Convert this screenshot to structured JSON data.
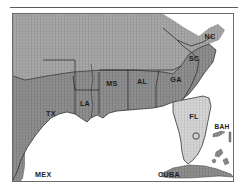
{
  "figure": {
    "type": "map",
    "frame_border_color": "#6b6b6b",
    "top_rule_color": "#5a5a5a"
  },
  "map": {
    "ocean_color": "#ffffff",
    "land_default_color": "#9a9a9a",
    "study_region_color": "#848484",
    "highlight_color": "#cfcfcf",
    "border_line_color": "#2b2b2b",
    "labels": [
      {
        "id": "tx",
        "text": "TX",
        "x": 38,
        "y": 102,
        "size": "normal"
      },
      {
        "id": "la",
        "text": "LA",
        "x": 72,
        "y": 92,
        "size": "normal"
      },
      {
        "id": "ms",
        "text": "MS",
        "x": 99,
        "y": 72,
        "size": "normal"
      },
      {
        "id": "al",
        "text": "AL",
        "x": 129,
        "y": 70,
        "size": "normal"
      },
      {
        "id": "ga",
        "text": "GA",
        "x": 163,
        "y": 68,
        "size": "normal"
      },
      {
        "id": "sc",
        "text": "SC",
        "x": 181,
        "y": 47,
        "size": "normal"
      },
      {
        "id": "nc",
        "text": "NC",
        "x": 197,
        "y": 25,
        "size": "normal"
      },
      {
        "id": "fl",
        "text": "FL",
        "x": 181,
        "y": 105,
        "size": "normal"
      },
      {
        "id": "bah",
        "text": "BAH",
        "x": 222,
        "y": 115,
        "size": "small"
      },
      {
        "id": "mex",
        "text": "MEX",
        "x": 22,
        "y": 163,
        "size": "normal"
      },
      {
        "id": "cuba",
        "text": "CUBA",
        "x": 145,
        "y": 163,
        "size": "normal"
      }
    ],
    "markers": [
      {
        "id": "florida-site-marker",
        "shape": "circle",
        "x": 183,
        "y": 122,
        "r": 3.2
      }
    ],
    "regions": [
      {
        "id": "northern-states",
        "name": "Northern / inland states",
        "shade": "light-gray"
      },
      {
        "id": "texas",
        "name": "Texas",
        "shade": "medium-gray"
      },
      {
        "id": "louisiana",
        "name": "Louisiana",
        "shade": "medium-gray"
      },
      {
        "id": "mississippi",
        "name": "Mississippi",
        "shade": "medium-gray"
      },
      {
        "id": "alabama",
        "name": "Alabama",
        "shade": "medium-gray"
      },
      {
        "id": "georgia",
        "name": "Georgia",
        "shade": "medium-gray"
      },
      {
        "id": "south-carolina",
        "name": "South Carolina",
        "shade": "medium-gray"
      },
      {
        "id": "north-carolina",
        "name": "North Carolina",
        "shade": "medium-gray"
      },
      {
        "id": "florida",
        "name": "Florida",
        "shade": "light-highlight"
      },
      {
        "id": "mexico",
        "name": "Mexico",
        "shade": "medium-gray"
      },
      {
        "id": "cuba",
        "name": "Cuba",
        "shade": "medium-gray"
      },
      {
        "id": "bahamas",
        "name": "Bahamas",
        "shade": "medium-gray"
      }
    ]
  }
}
